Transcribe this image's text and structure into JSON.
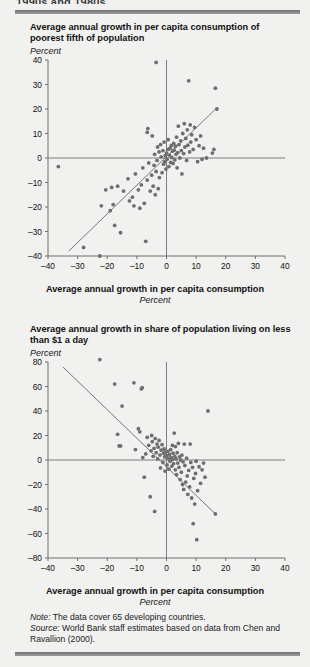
{
  "running_head": "1990s and 1980s",
  "colors": {
    "page_bg": "#f1f1ef",
    "rule": "#7d7d7d",
    "axis": "#6f6f6f",
    "point": "#6e6e6e",
    "trend": "#6a6a6a",
    "text": "#111111"
  },
  "chart_data": [
    {
      "type": "scatter",
      "index": 0,
      "title": "Average annual growth in per capita consumption of poorest fifth of population",
      "ylabel": "Percent",
      "xlabel": "Average annual growth in per capita consumption",
      "xunit": "Percent",
      "xlim": [
        -40,
        40
      ],
      "ylim": [
        -40,
        40
      ],
      "xticks": [
        -40,
        -30,
        -20,
        -10,
        0,
        10,
        20,
        30,
        40
      ],
      "yticks": [
        -40,
        -30,
        -20,
        -10,
        0,
        10,
        20,
        30,
        40
      ],
      "xticklabels": [
        "–40",
        "–30",
        "–20",
        "–10",
        "0",
        "10",
        "20",
        "30",
        "40"
      ],
      "yticklabels": [
        "–40",
        "–30",
        "–20",
        "–10",
        "0",
        "10",
        "20",
        "30",
        "40"
      ],
      "grid": false,
      "zero_lines": true,
      "legend": "none",
      "trendline": {
        "x0": -33.0,
        "y0": -38.0,
        "x1": 17.0,
        "y1": 20.5
      },
      "points": [
        [
          -36.5,
          -3.5
        ],
        [
          -28.0,
          -36.5
        ],
        [
          -22.5,
          -40.0
        ],
        [
          -22.0,
          -19.5
        ],
        [
          -20.5,
          -13.0
        ],
        [
          -19.0,
          -21.5
        ],
        [
          -18.5,
          -12.0
        ],
        [
          -18.0,
          -19.0
        ],
        [
          -17.5,
          -27.5
        ],
        [
          -16.5,
          -11.5
        ],
        [
          -15.5,
          -30.5
        ],
        [
          -14.5,
          -13.5
        ],
        [
          -13.0,
          -8.5
        ],
        [
          -12.5,
          -17.5
        ],
        [
          -11.5,
          -16.0
        ],
        [
          -11.0,
          -19.5
        ],
        [
          -10.5,
          -6.5
        ],
        [
          -9.5,
          -13.0
        ],
        [
          -9.0,
          -20.5
        ],
        [
          -8.5,
          -11.0
        ],
        [
          -8.0,
          -4.0
        ],
        [
          -7.5,
          -18.5
        ],
        [
          -7.0,
          -34.0
        ],
        [
          -6.5,
          -9.0
        ],
        [
          -6.5,
          10.5
        ],
        [
          -6.3,
          12.0
        ],
        [
          -6.0,
          -2.0
        ],
        [
          -5.5,
          -13.5
        ],
        [
          -5.0,
          -7.0
        ],
        [
          -4.8,
          9.0
        ],
        [
          -4.5,
          -11.5
        ],
        [
          -4.2,
          -3.0
        ],
        [
          -4.0,
          1.5
        ],
        [
          -3.8,
          -15.0
        ],
        [
          -3.5,
          39.0
        ],
        [
          -3.5,
          -5.5
        ],
        [
          -3.2,
          -1.0
        ],
        [
          -3.0,
          4.5
        ],
        [
          -2.8,
          -12.5
        ],
        [
          -2.5,
          2.5
        ],
        [
          -2.4,
          -8.0
        ],
        [
          -2.0,
          5.5
        ],
        [
          -1.8,
          0.5
        ],
        [
          -1.5,
          -6.0
        ],
        [
          -1.2,
          3.0
        ],
        [
          -1.0,
          -2.5
        ],
        [
          -0.8,
          6.5
        ],
        [
          -0.6,
          -1.5
        ],
        [
          -0.4,
          1.0
        ],
        [
          -0.2,
          -4.5
        ],
        [
          0.0,
          2.0
        ],
        [
          0.2,
          -0.5
        ],
        [
          0.5,
          3.5
        ],
        [
          0.6,
          7.5
        ],
        [
          0.8,
          -3.5
        ],
        [
          1.0,
          1.2
        ],
        [
          1.2,
          4.0
        ],
        [
          1.4,
          -1.8
        ],
        [
          1.6,
          5.0
        ],
        [
          1.8,
          0.2
        ],
        [
          2.0,
          2.8
        ],
        [
          2.2,
          -2.2
        ],
        [
          2.4,
          6.0
        ],
        [
          2.6,
          3.2
        ],
        [
          2.8,
          -0.8
        ],
        [
          3.0,
          4.8
        ],
        [
          3.2,
          1.5
        ],
        [
          3.4,
          8.5
        ],
        [
          3.6,
          -4.0
        ],
        [
          3.8,
          2.2
        ],
        [
          4.0,
          13.0
        ],
        [
          4.2,
          5.5
        ],
        [
          4.5,
          0.0
        ],
        [
          4.8,
          7.0
        ],
        [
          5.0,
          3.0
        ],
        [
          5.2,
          -6.5
        ],
        [
          5.5,
          10.0
        ],
        [
          5.8,
          1.8
        ],
        [
          6.0,
          14.0
        ],
        [
          6.2,
          4.5
        ],
        [
          6.5,
          8.0
        ],
        [
          6.8,
          -1.0
        ],
        [
          7.0,
          11.5
        ],
        [
          7.2,
          5.2
        ],
        [
          7.5,
          31.5
        ],
        [
          7.8,
          2.5
        ],
        [
          8.0,
          13.5
        ],
        [
          8.2,
          6.5
        ],
        [
          8.5,
          9.5
        ],
        [
          9.0,
          3.5
        ],
        [
          9.5,
          12.5
        ],
        [
          10.0,
          7.5
        ],
        [
          10.5,
          -1.5
        ],
        [
          11.0,
          5.0
        ],
        [
          11.5,
          9.0
        ],
        [
          12.0,
          -0.5
        ],
        [
          12.5,
          4.0
        ],
        [
          13.5,
          0.0
        ],
        [
          15.5,
          2.0
        ],
        [
          16.5,
          28.5
        ],
        [
          17.0,
          20.0
        ],
        [
          16.0,
          3.5
        ]
      ]
    },
    {
      "type": "scatter",
      "index": 1,
      "title": "Average annual growth in share of population living on less than $1 a day",
      "ylabel": "Percent",
      "xlabel": "Average annual growth in per capita consumption",
      "xunit": "Percent",
      "xlim": [
        -40,
        40
      ],
      "ylim": [
        -80,
        80
      ],
      "xticks": [
        -40,
        -30,
        -20,
        -10,
        0,
        10,
        20,
        30,
        40
      ],
      "yticks": [
        -80,
        -60,
        -40,
        -20,
        0,
        20,
        40,
        60,
        80
      ],
      "xticklabels": [
        "–40",
        "–30",
        "–20",
        "–10",
        "0",
        "10",
        "20",
        "30",
        "40"
      ],
      "yticklabels": [
        "–80",
        "–60",
        "–40",
        "–20",
        "0",
        "20",
        "40",
        "60",
        "80"
      ],
      "grid": false,
      "zero_lines": true,
      "legend": "none",
      "trendline": {
        "x0": -35.0,
        "y0": 76.0,
        "x1": 16.5,
        "y1": -44.0
      },
      "points": [
        [
          -22.5,
          82.0
        ],
        [
          -17.5,
          62.0
        ],
        [
          -16.5,
          21.0
        ],
        [
          -16.0,
          11.5
        ],
        [
          -15.5,
          11.5
        ],
        [
          -15.0,
          44.0
        ],
        [
          -11.0,
          63.0
        ],
        [
          -10.5,
          8.5
        ],
        [
          -9.5,
          25.5
        ],
        [
          -9.0,
          23.0
        ],
        [
          -8.5,
          58.0
        ],
        [
          -8.2,
          59.0
        ],
        [
          -8.0,
          2.0
        ],
        [
          -7.5,
          -14.0
        ],
        [
          -7.0,
          5.0
        ],
        [
          -6.5,
          18.5
        ],
        [
          -6.0,
          12.0
        ],
        [
          -5.5,
          -30.0
        ],
        [
          -5.2,
          7.5
        ],
        [
          -5.0,
          20.0
        ],
        [
          -4.8,
          15.0
        ],
        [
          -4.5,
          3.0
        ],
        [
          -4.2,
          9.5
        ],
        [
          -4.0,
          -42.0
        ],
        [
          -3.8,
          17.5
        ],
        [
          -3.5,
          6.0
        ],
        [
          -3.2,
          13.0
        ],
        [
          -3.0,
          1.0
        ],
        [
          -2.8,
          10.5
        ],
        [
          -2.5,
          16.0
        ],
        [
          -2.2,
          4.0
        ],
        [
          -2.0,
          -6.5
        ],
        [
          -1.8,
          8.0
        ],
        [
          -1.5,
          12.5
        ],
        [
          -1.2,
          -2.0
        ],
        [
          -1.0,
          5.5
        ],
        [
          -0.8,
          9.0
        ],
        [
          -0.6,
          2.5
        ],
        [
          -0.5,
          -9.0
        ],
        [
          -0.3,
          6.5
        ],
        [
          0.0,
          3.5
        ],
        [
          0.2,
          -4.0
        ],
        [
          0.4,
          7.0
        ],
        [
          0.6,
          1.5
        ],
        [
          0.8,
          -7.5
        ],
        [
          1.0,
          4.5
        ],
        [
          1.2,
          -1.0
        ],
        [
          1.4,
          8.5
        ],
        [
          1.6,
          2.0
        ],
        [
          1.8,
          -5.0
        ],
        [
          2.0,
          0.5
        ],
        [
          2.2,
          5.5
        ],
        [
          2.4,
          -3.0
        ],
        [
          2.6,
          22.0
        ],
        [
          2.8,
          3.0
        ],
        [
          3.0,
          -8.0
        ],
        [
          3.2,
          1.0
        ],
        [
          3.4,
          -12.0
        ],
        [
          3.6,
          6.0
        ],
        [
          3.8,
          -2.5
        ],
        [
          4.0,
          13.5
        ],
        [
          4.2,
          -6.0
        ],
        [
          4.4,
          2.5
        ],
        [
          4.6,
          -16.0
        ],
        [
          4.8,
          0.0
        ],
        [
          5.0,
          -10.0
        ],
        [
          5.2,
          4.0
        ],
        [
          5.4,
          -20.0
        ],
        [
          5.6,
          -1.5
        ],
        [
          5.8,
          -24.0
        ],
        [
          6.0,
          13.0
        ],
        [
          6.2,
          -4.5
        ],
        [
          6.5,
          -18.0
        ],
        [
          6.8,
          1.5
        ],
        [
          7.0,
          -13.0
        ],
        [
          7.2,
          -28.0
        ],
        [
          7.5,
          -8.5
        ],
        [
          7.8,
          -22.0
        ],
        [
          8.0,
          13.0
        ],
        [
          8.2,
          -2.0
        ],
        [
          8.5,
          -31.0
        ],
        [
          8.8,
          -6.0
        ],
        [
          9.0,
          -52.0
        ],
        [
          9.2,
          -15.0
        ],
        [
          9.5,
          -36.0
        ],
        [
          9.8,
          -11.0
        ],
        [
          10.0,
          -1.0
        ],
        [
          10.2,
          -65.0
        ],
        [
          10.5,
          -25.0
        ],
        [
          11.0,
          -5.5
        ],
        [
          11.5,
          -19.0
        ],
        [
          12.0,
          -8.0
        ],
        [
          12.5,
          -2.5
        ],
        [
          13.0,
          -14.0
        ],
        [
          14.0,
          40.0
        ],
        [
          16.5,
          -44.0
        ],
        [
          2.0,
          12.0
        ],
        [
          3.0,
          11.0
        ]
      ]
    }
  ],
  "notes": {
    "note_label": "Note:",
    "note_text": " The data cover 65 developing countries.",
    "source_label": "Source:",
    "source_text": " World Bank staff estimates based on data from Chen and Ravallion (2000)."
  }
}
